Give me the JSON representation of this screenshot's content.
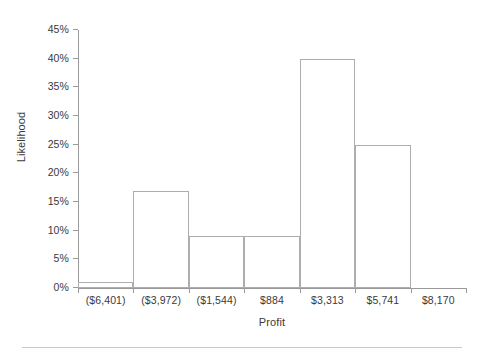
{
  "chart_data": {
    "type": "bar",
    "title": "",
    "subtitle": "",
    "xlabel": "Profit",
    "ylabel": "Likelihood",
    "categories": [
      "($6,401)",
      "($3,972)",
      "($1,544)",
      "$884",
      "$3,313",
      "$5,741",
      "$8,170"
    ],
    "values": [
      1,
      17,
      9,
      9,
      40,
      25,
      0
    ],
    "value_labels": [
      "1%",
      "17%",
      "9%",
      "9%",
      "40%",
      "25%",
      "0%"
    ],
    "ylim": [
      0,
      45
    ],
    "ytick_values": [
      0,
      5,
      10,
      15,
      20,
      25,
      30,
      35,
      40,
      45
    ],
    "ytick_labels": [
      "0%",
      "5%",
      "10%",
      "15%",
      "20%",
      "25%",
      "30%",
      "35%",
      "40%",
      "45%"
    ],
    "grid": false,
    "legend": null,
    "legend_position": "none",
    "bar_style": "outline",
    "bar_fill_color": "#ffffff",
    "bar_border_color": "#adadad",
    "axis_color": "#9a9a9a",
    "text_color": "#3a3a3a",
    "background_color": "#ffffff"
  },
  "footer": {
    "rule_color": "#c9c9c9"
  }
}
